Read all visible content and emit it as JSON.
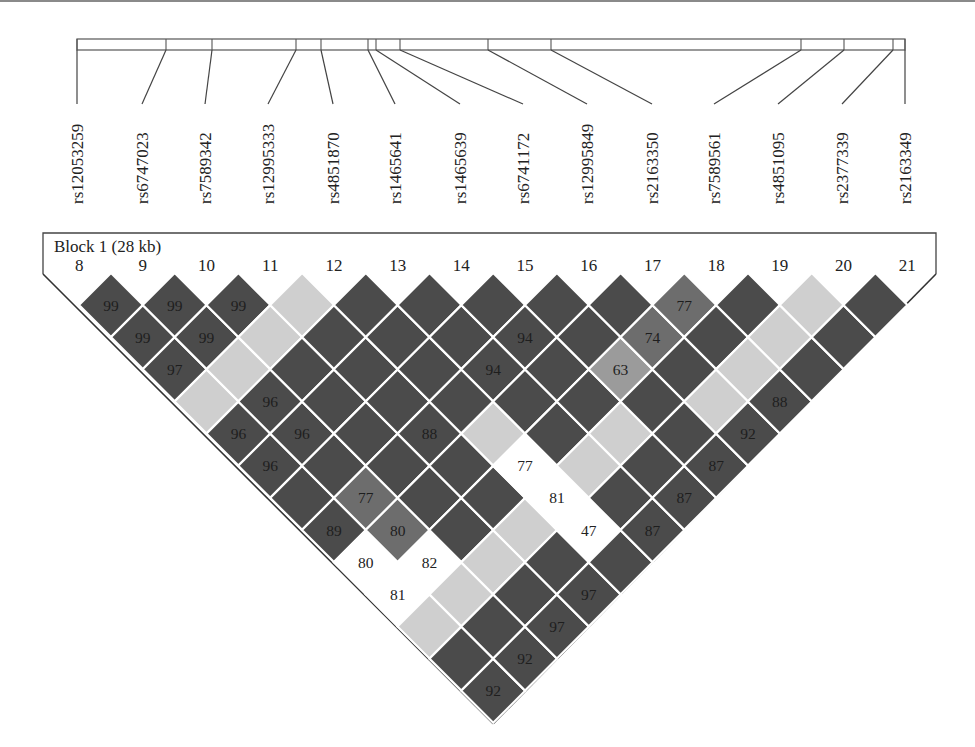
{
  "chart_data": {
    "type": "heatmap",
    "block": {
      "label": "Block 1 (28 kb)"
    },
    "markers": [
      8,
      9,
      10,
      11,
      12,
      13,
      14,
      15,
      16,
      17,
      18,
      19,
      20,
      21
    ],
    "snps": [
      "rs12053259",
      "rs6747023",
      "rs7589342",
      "rs12995333",
      "rs4851870",
      "rs1465641",
      "rs1465639",
      "rs6741172",
      "rs12995849",
      "rs2163350",
      "rs7589561",
      "rs4851095",
      "rs2377339",
      "rs2163349"
    ],
    "bar_tick_x": [
      77,
      166,
      212,
      296,
      321,
      368,
      376,
      400,
      488,
      551,
      801,
      844,
      893,
      905
    ],
    "label_x": [
      77,
      142,
      205,
      268,
      333,
      395,
      460,
      523,
      587,
      652,
      714,
      778,
      842,
      905
    ],
    "colors": {
      "dark": "#4b4b4b",
      "medium": "#6d6d6d",
      "midlight": "#9b9b9b",
      "light": "#cfcfcf",
      "white": "#ffffff"
    },
    "default_level": "dark",
    "cells": [
      {
        "a": 8,
        "b": 9,
        "level": "dark",
        "value": "99"
      },
      {
        "a": 9,
        "b": 10,
        "level": "dark",
        "value": "99"
      },
      {
        "a": 10,
        "b": 11,
        "level": "dark",
        "value": "99"
      },
      {
        "a": 11,
        "b": 12,
        "level": "light",
        "value": ""
      },
      {
        "a": 17,
        "b": 18,
        "level": "medium",
        "value": "77"
      },
      {
        "a": 19,
        "b": 20,
        "level": "light",
        "value": ""
      },
      {
        "a": 8,
        "b": 10,
        "level": "dark",
        "value": "99"
      },
      {
        "a": 9,
        "b": 11,
        "level": "dark",
        "value": "99"
      },
      {
        "a": 10,
        "b": 12,
        "level": "light",
        "value": ""
      },
      {
        "a": 14,
        "b": 16,
        "level": "dark",
        "value": "94"
      },
      {
        "a": 16,
        "b": 18,
        "level": "medium",
        "value": "74"
      },
      {
        "a": 18,
        "b": 20,
        "level": "light",
        "value": ""
      },
      {
        "a": 8,
        "b": 11,
        "level": "dark",
        "value": "97"
      },
      {
        "a": 9,
        "b": 12,
        "level": "light",
        "value": ""
      },
      {
        "a": 13,
        "b": 16,
        "level": "dark",
        "value": "94"
      },
      {
        "a": 15,
        "b": 18,
        "level": "midlight",
        "value": "63"
      },
      {
        "a": 17,
        "b": 20,
        "level": "light",
        "value": ""
      },
      {
        "a": 8,
        "b": 12,
        "level": "light",
        "value": ""
      },
      {
        "a": 9,
        "b": 13,
        "level": "dark",
        "value": "96"
      },
      {
        "a": 16,
        "b": 20,
        "level": "light",
        "value": ""
      },
      {
        "a": 17,
        "b": 21,
        "level": "dark",
        "value": "88"
      },
      {
        "a": 8,
        "b": 13,
        "level": "dark",
        "value": "96"
      },
      {
        "a": 9,
        "b": 14,
        "level": "dark",
        "value": "96"
      },
      {
        "a": 11,
        "b": 16,
        "level": "dark",
        "value": "88"
      },
      {
        "a": 12,
        "b": 17,
        "level": "light",
        "value": ""
      },
      {
        "a": 14,
        "b": 19,
        "level": "light",
        "value": ""
      },
      {
        "a": 16,
        "b": 21,
        "level": "dark",
        "value": "92"
      },
      {
        "a": 8,
        "b": 14,
        "level": "dark",
        "value": "96"
      },
      {
        "a": 12,
        "b": 18,
        "level": "white",
        "value": "77"
      },
      {
        "a": 13,
        "b": 19,
        "level": "light",
        "value": ""
      },
      {
        "a": 15,
        "b": 21,
        "level": "dark",
        "value": "87"
      },
      {
        "a": 9,
        "b": 16,
        "level": "medium",
        "value": "77"
      },
      {
        "a": 12,
        "b": 19,
        "level": "white",
        "value": "81"
      },
      {
        "a": 14,
        "b": 21,
        "level": "dark",
        "value": "87"
      },
      {
        "a": 8,
        "b": 16,
        "level": "dark",
        "value": "89"
      },
      {
        "a": 9,
        "b": 17,
        "level": "medium",
        "value": "80"
      },
      {
        "a": 11,
        "b": 19,
        "level": "light",
        "value": ""
      },
      {
        "a": 12,
        "b": 20,
        "level": "white",
        "value": "47"
      },
      {
        "a": 13,
        "b": 21,
        "level": "dark",
        "value": "87"
      },
      {
        "a": 8,
        "b": 17,
        "level": "white",
        "value": "80"
      },
      {
        "a": 9,
        "b": 18,
        "level": "white",
        "value": "82"
      },
      {
        "a": 10,
        "b": 19,
        "level": "light",
        "value": ""
      },
      {
        "a": 8,
        "b": 18,
        "level": "white",
        "value": "81"
      },
      {
        "a": 9,
        "b": 19,
        "level": "light",
        "value": ""
      },
      {
        "a": 11,
        "b": 21,
        "level": "dark",
        "value": "97"
      },
      {
        "a": 8,
        "b": 19,
        "level": "light",
        "value": ""
      },
      {
        "a": 10,
        "b": 21,
        "level": "dark",
        "value": "97"
      },
      {
        "a": 9,
        "b": 21,
        "level": "dark",
        "value": "92"
      },
      {
        "a": 8,
        "b": 21,
        "level": "dark",
        "value": "92"
      }
    ]
  }
}
